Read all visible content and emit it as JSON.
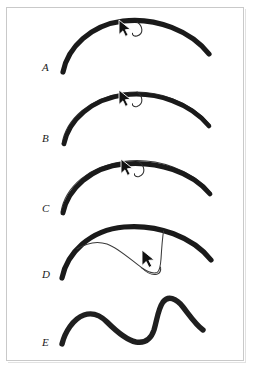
{
  "figure": {
    "background_color": "#ffffff",
    "frame_color": "#c9c9c9",
    "stroke_color": "#1a1a1a",
    "thin_stroke_color": "#3a3a3a",
    "width": 253,
    "height": 371,
    "panel_count": 5
  },
  "panels": [
    {
      "label": "A",
      "caption_letter": "A",
      "description": "Thick hand-drawn arc with mouse cursor and small curved gesture mark near apex",
      "has_cursor": true,
      "has_thin_overlay": false,
      "has_gesture_arc": true,
      "cursor": {
        "x": 122,
        "y": 22
      },
      "gesture": {
        "x": 132,
        "y": 30
      }
    },
    {
      "label": "B",
      "caption_letter": "B",
      "description": "Thick arc with thin duplicate outline offset above, cursor at apex",
      "has_cursor": true,
      "has_thin_overlay": true,
      "has_gesture_arc": true,
      "cursor": {
        "x": 122,
        "y": 92
      },
      "gesture": {
        "x": 132,
        "y": 100
      }
    },
    {
      "label": "C",
      "caption_letter": "C",
      "description": "Thick arc with thin duplicate outline, cursor pulled slightly downward from apex",
      "has_cursor": true,
      "has_thin_overlay": true,
      "has_gesture_arc": true,
      "cursor": {
        "x": 124,
        "y": 160
      },
      "gesture": {
        "x": 135,
        "y": 168
      }
    },
    {
      "label": "D",
      "caption_letter": "D",
      "description": "Thick arc with thin line dragged far down into a deep notch, cursor at the pull point",
      "has_cursor": true,
      "has_thin_overlay": true,
      "has_gesture_arc": false,
      "cursor": {
        "x": 158,
        "y": 253
      }
    },
    {
      "label": "E",
      "caption_letter": "E",
      "description": "Resulting thick deformed curve: broad hump, dip, then sharp narrow peak",
      "has_cursor": false,
      "has_thin_overlay": false,
      "has_gesture_arc": false
    }
  ]
}
